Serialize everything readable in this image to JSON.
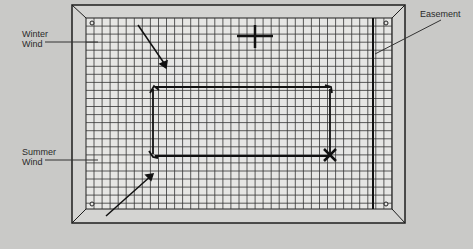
{
  "diagram": {
    "labels": {
      "winter_wind": [
        "Winter",
        "Wind"
      ],
      "summer_wind": [
        "Summer",
        "Wind"
      ],
      "easement": "Easement"
    },
    "symbols": {
      "north_marker": "crosshair-plus",
      "site_marker": "x-mark",
      "corner_markers": "small-circle"
    },
    "colors": {
      "background": "#c9c9c7",
      "grid_paper": "#e6e6e4",
      "ink": "#1e1e1e",
      "frame": "#d4d4d2"
    },
    "caption_fragment": ""
  }
}
